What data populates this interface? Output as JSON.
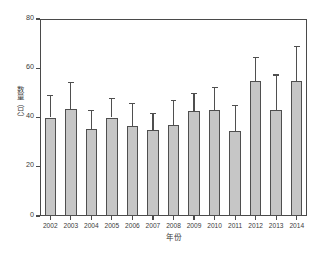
{
  "chart_data": {
    "type": "bar",
    "title": "",
    "xlabel": "年份",
    "ylabel": "数量（只）",
    "categories": [
      "2002",
      "2003",
      "2004",
      "2005",
      "2006",
      "2007",
      "2008",
      "2009",
      "2010",
      "2011",
      "2012",
      "2013",
      "2014"
    ],
    "values": [
      40,
      43.5,
      35.5,
      40,
      36.5,
      35,
      37,
      42.5,
      43,
      34.5,
      55,
      43,
      55
    ],
    "error_upper": [
      9,
      11,
      7.5,
      8,
      9.5,
      7,
      10,
      7.5,
      9.5,
      10.5,
      9.5,
      14.5,
      14
    ],
    "error_upper_absolute": [
      49,
      54.5,
      43,
      48,
      46,
      42,
      47,
      50,
      52.5,
      45,
      64.5,
      57.5,
      69
    ],
    "ylim": [
      0,
      80
    ],
    "yticks": [
      0,
      20,
      40,
      60,
      80
    ],
    "ytick_labels": [
      "0",
      "20",
      "40",
      "60",
      "80"
    ],
    "grid": false,
    "legend": null,
    "bar_color": "#c6c6c6",
    "bar_edge_color": "#4f4f4f",
    "axis_color": "#4a4a4a",
    "error_bar_style": "upper-only"
  }
}
